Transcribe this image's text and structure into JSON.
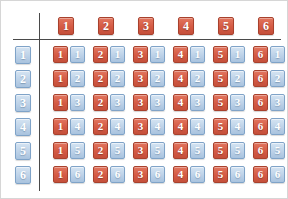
{
  "figure": {
    "kind": "dice-sample-space-table",
    "colors": {
      "red_tile": "#d45a44",
      "red_border": "#a8412d",
      "blue_tile": "#bdd2e8",
      "blue_border": "#7fa3c8",
      "axis_rule": "#4a4a4a",
      "background": "#ffffff"
    }
  },
  "column_header": {
    "name": "first-die",
    "tiles": [
      "1",
      "2",
      "3",
      "4",
      "5",
      "6"
    ]
  },
  "row_header": {
    "name": "second-die",
    "tiles": [
      "1",
      "2",
      "3",
      "4",
      "5",
      "6"
    ]
  },
  "grid": {
    "rows": [
      {
        "row_label": "1",
        "cells": [
          {
            "red": "1",
            "blue": "1"
          },
          {
            "red": "2",
            "blue": "1"
          },
          {
            "red": "3",
            "blue": "1"
          },
          {
            "red": "4",
            "blue": "1"
          },
          {
            "red": "5",
            "blue": "1"
          },
          {
            "red": "6",
            "blue": "1"
          }
        ]
      },
      {
        "row_label": "2",
        "cells": [
          {
            "red": "1",
            "blue": "2"
          },
          {
            "red": "2",
            "blue": "2"
          },
          {
            "red": "3",
            "blue": "2"
          },
          {
            "red": "4",
            "blue": "2"
          },
          {
            "red": "5",
            "blue": "2"
          },
          {
            "red": "6",
            "blue": "2"
          }
        ]
      },
      {
        "row_label": "3",
        "cells": [
          {
            "red": "1",
            "blue": "3"
          },
          {
            "red": "2",
            "blue": "3"
          },
          {
            "red": "3",
            "blue": "3"
          },
          {
            "red": "4",
            "blue": "3"
          },
          {
            "red": "5",
            "blue": "3"
          },
          {
            "red": "6",
            "blue": "3"
          }
        ]
      },
      {
        "row_label": "4",
        "cells": [
          {
            "red": "1",
            "blue": "4"
          },
          {
            "red": "2",
            "blue": "4"
          },
          {
            "red": "3",
            "blue": "4"
          },
          {
            "red": "4",
            "blue": "4"
          },
          {
            "red": "5",
            "blue": "4"
          },
          {
            "red": "6",
            "blue": "4"
          }
        ]
      },
      {
        "row_label": "5",
        "cells": [
          {
            "red": "1",
            "blue": "5"
          },
          {
            "red": "2",
            "blue": "5"
          },
          {
            "red": "3",
            "blue": "5"
          },
          {
            "red": "4",
            "blue": "5"
          },
          {
            "red": "5",
            "blue": "5"
          },
          {
            "red": "6",
            "blue": "5"
          }
        ]
      },
      {
        "row_label": "6",
        "cells": [
          {
            "red": "1",
            "blue": "6"
          },
          {
            "red": "2",
            "blue": "6"
          },
          {
            "red": "3",
            "blue": "6"
          },
          {
            "red": "4",
            "blue": "6"
          },
          {
            "red": "5",
            "blue": "6"
          },
          {
            "red": "6",
            "blue": "6"
          }
        ]
      }
    ]
  },
  "layout": {
    "col_x": [
      52,
      92,
      132,
      172,
      212,
      252
    ],
    "header_x": [
      57,
      97,
      137,
      177,
      217,
      257
    ],
    "row_y": [
      45,
      69,
      93,
      117,
      141,
      165
    ],
    "header_y": 16,
    "row_label_x": 14,
    "pair_gap": 17
  }
}
